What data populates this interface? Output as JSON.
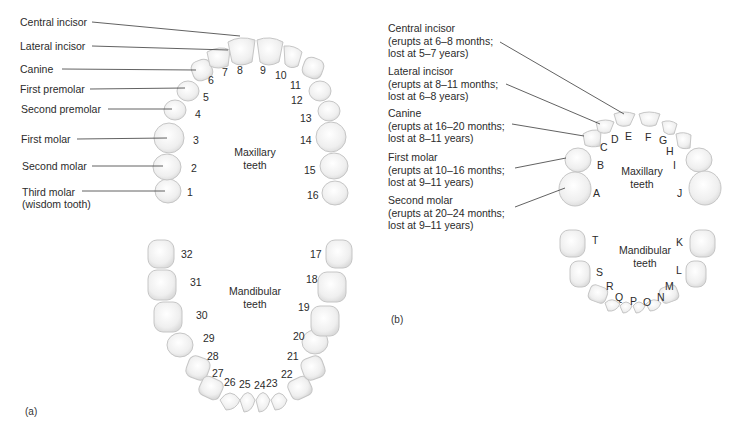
{
  "figure_a": {
    "panel_label": "(a)",
    "maxillary_title_1": "Maxillary",
    "maxillary_title_2": "teeth",
    "mandibular_title_1": "Mandibular",
    "mandibular_title_2": "teeth",
    "callouts": [
      {
        "text": "Central incisor"
      },
      {
        "text": "Lateral incisor"
      },
      {
        "text": "Canine"
      },
      {
        "text": "First premolar"
      },
      {
        "text": "Second premolar"
      },
      {
        "text": "First molar"
      },
      {
        "text": "Second molar"
      },
      {
        "text": "Third molar"
      },
      {
        "text": "(wisdom tooth)"
      }
    ],
    "tooth_numbers": [
      "1",
      "2",
      "3",
      "4",
      "5",
      "6",
      "7",
      "8",
      "9",
      "10",
      "11",
      "12",
      "13",
      "14",
      "15",
      "16",
      "17",
      "18",
      "19",
      "20",
      "21",
      "22",
      "23",
      "24",
      "25",
      "26",
      "27",
      "28",
      "29",
      "30",
      "31",
      "32"
    ]
  },
  "figure_b": {
    "panel_label": "(b)",
    "maxillary_title_1": "Maxillary",
    "maxillary_title_2": "teeth",
    "mandibular_title_1": "Mandibular",
    "mandibular_title_2": "teeth",
    "callouts": [
      {
        "line1": "Central incisor",
        "line2": "(erupts at 6–8 months;",
        "line3": "lost at 5–7 years)"
      },
      {
        "line1": "Lateral incisor",
        "line2": "(erupts at 8–11 months;",
        "line3": "lost at 6–8 years)"
      },
      {
        "line1": "Canine",
        "line2": "(erupts at 16–20 months;",
        "line3": "lost at 8–11 years)"
      },
      {
        "line1": "First molar",
        "line2": "(erupts at 10–16 months;",
        "line3": "lost at 9–11 years)"
      },
      {
        "line1": "Second molar",
        "line2": "(erupts at 20–24 months;",
        "line3": "lost at 9–11 years)"
      }
    ],
    "tooth_letters": [
      "A",
      "B",
      "C",
      "D",
      "E",
      "F",
      "G",
      "H",
      "I",
      "J",
      "K",
      "L",
      "M",
      "N",
      "O",
      "P",
      "Q",
      "R",
      "S",
      "T"
    ]
  },
  "colors": {
    "tooth_fill": "#f2f2f2",
    "tooth_stroke": "#c8c8c8",
    "leader_line": "#3a3a3a",
    "text": "#2b2b2b"
  }
}
